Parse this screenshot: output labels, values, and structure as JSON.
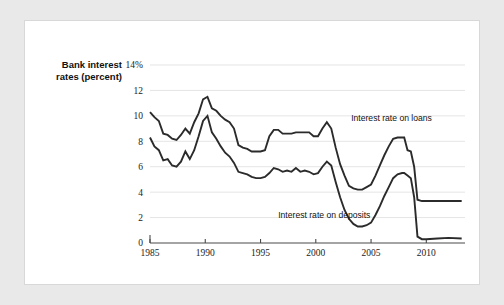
{
  "figure": {
    "background_color": "#e9e9e9",
    "card_color": "#ffffff",
    "axis_title_line1": "Bank interest",
    "axis_title_line2": "rates (percent)",
    "top_tick_label": "14%"
  },
  "chart_data": {
    "type": "line",
    "title": "",
    "xlabel": "",
    "ylabel": "Bank interest rates (percent)",
    "xlim": [
      1985,
      2013.5
    ],
    "ylim": [
      0,
      14
    ],
    "grid": true,
    "legend": "inline-annotations",
    "line_color": "#2b2b2b",
    "y_ticks": [
      0,
      2,
      4,
      6,
      8,
      10,
      12,
      14
    ],
    "y_tick_labels": [
      "0",
      "2",
      "4",
      "6",
      "8",
      "10",
      "12",
      "14%"
    ],
    "x_ticks": [
      1985,
      1990,
      1995,
      2000,
      2005,
      2010
    ],
    "x_tick_labels": [
      "1985",
      "1990",
      "1995",
      "2000",
      "2005",
      "2010"
    ],
    "annotations": [
      {
        "text": "Interest rate on loans",
        "x": 2003.2,
        "y": 9.6
      },
      {
        "text": "Interest rate on deposits",
        "x": 1996.6,
        "y": 2.0
      }
    ],
    "series": [
      {
        "name": "Interest rate on loans",
        "label": "Interest rate on loans",
        "x": [
          1985.0,
          1985.4,
          1985.8,
          1986.2,
          1986.6,
          1987.0,
          1987.4,
          1987.8,
          1988.2,
          1988.6,
          1989.0,
          1989.4,
          1989.8,
          1990.2,
          1990.6,
          1991.0,
          1991.4,
          1991.8,
          1992.2,
          1992.6,
          1993.0,
          1993.4,
          1993.8,
          1994.2,
          1994.6,
          1995.0,
          1995.4,
          1995.8,
          1996.2,
          1996.6,
          1997.0,
          1997.4,
          1997.8,
          1998.2,
          1998.6,
          1999.0,
          1999.4,
          1999.8,
          2000.2,
          2000.6,
          2001.0,
          2001.4,
          2001.8,
          2002.2,
          2002.6,
          2003.0,
          2003.4,
          2003.8,
          2004.2,
          2004.6,
          2005.0,
          2005.4,
          2005.8,
          2006.2,
          2006.6,
          2007.0,
          2007.4,
          2007.8,
          2008.0,
          2008.3,
          2008.6,
          2008.9,
          2009.2,
          2009.6,
          2010.0,
          2011.0,
          2012.0,
          2013.2
        ],
        "y": [
          10.3,
          9.9,
          9.6,
          8.6,
          8.5,
          8.2,
          8.1,
          8.5,
          9.0,
          8.6,
          9.5,
          10.2,
          11.3,
          11.5,
          10.6,
          10.4,
          10.0,
          9.7,
          9.5,
          9.0,
          7.7,
          7.5,
          7.4,
          7.2,
          7.2,
          7.2,
          7.3,
          8.4,
          8.9,
          8.9,
          8.6,
          8.6,
          8.6,
          8.7,
          8.7,
          8.7,
          8.7,
          8.4,
          8.4,
          9.0,
          9.5,
          9.0,
          7.5,
          6.2,
          5.3,
          4.5,
          4.3,
          4.2,
          4.2,
          4.4,
          4.6,
          5.3,
          6.1,
          6.9,
          7.6,
          8.2,
          8.3,
          8.3,
          8.3,
          7.3,
          7.2,
          6.0,
          3.4,
          3.3,
          3.3,
          3.3,
          3.3,
          3.3
        ]
      },
      {
        "name": "Interest rate on deposits",
        "label": "Interest rate on deposits",
        "x": [
          1985.0,
          1985.4,
          1985.8,
          1986.2,
          1986.6,
          1987.0,
          1987.4,
          1987.8,
          1988.2,
          1988.6,
          1989.0,
          1989.4,
          1989.8,
          1990.2,
          1990.6,
          1991.0,
          1991.4,
          1991.8,
          1992.2,
          1992.6,
          1993.0,
          1993.4,
          1993.8,
          1994.2,
          1994.6,
          1995.0,
          1995.4,
          1995.8,
          1996.2,
          1996.6,
          1997.0,
          1997.4,
          1997.8,
          1998.2,
          1998.6,
          1999.0,
          1999.4,
          1999.8,
          2000.2,
          2000.6,
          2001.0,
          2001.4,
          2001.8,
          2002.2,
          2002.6,
          2003.0,
          2003.4,
          2003.8,
          2004.2,
          2004.6,
          2005.0,
          2005.4,
          2005.8,
          2006.2,
          2006.6,
          2007.0,
          2007.4,
          2007.8,
          2008.0,
          2008.3,
          2008.6,
          2008.9,
          2009.2,
          2009.6,
          2010.0,
          2011.0,
          2012.0,
          2013.2
        ],
        "y": [
          8.3,
          7.6,
          7.3,
          6.5,
          6.6,
          6.1,
          6.0,
          6.4,
          7.2,
          6.6,
          7.3,
          8.4,
          9.6,
          10.0,
          8.7,
          8.2,
          7.6,
          7.1,
          6.8,
          6.3,
          5.6,
          5.5,
          5.4,
          5.2,
          5.1,
          5.1,
          5.2,
          5.5,
          5.9,
          5.8,
          5.6,
          5.7,
          5.6,
          5.9,
          5.6,
          5.7,
          5.6,
          5.4,
          5.5,
          6.0,
          6.4,
          6.1,
          4.8,
          3.6,
          2.6,
          1.9,
          1.5,
          1.3,
          1.3,
          1.4,
          1.6,
          2.2,
          2.9,
          3.7,
          4.4,
          5.1,
          5.4,
          5.5,
          5.5,
          5.3,
          5.1,
          3.6,
          0.5,
          0.3,
          0.3,
          0.35,
          0.4,
          0.35
        ]
      }
    ]
  }
}
